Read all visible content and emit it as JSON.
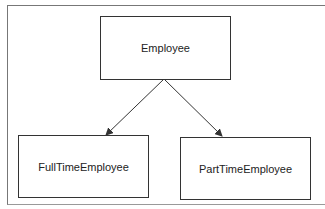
{
  "diagram": {
    "type": "class-hierarchy",
    "nodes": [
      {
        "id": "employee",
        "label": "Employee"
      },
      {
        "id": "fulltime",
        "label": "FullTimeEmployee"
      },
      {
        "id": "parttime",
        "label": "PartTimeEmployee"
      }
    ],
    "edges": [
      {
        "from": "employee",
        "to": "fulltime"
      },
      {
        "from": "employee",
        "to": "parttime"
      }
    ],
    "colors": {
      "stroke": "#333333",
      "background": "#ffffff"
    }
  }
}
